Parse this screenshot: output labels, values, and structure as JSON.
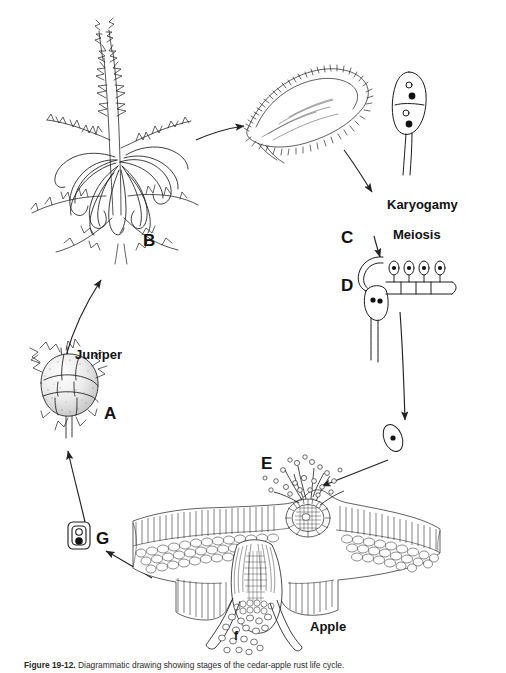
{
  "figure": {
    "title": "Cedar-apple rust life cycle",
    "stroke_color": "#1a1a1a",
    "fill_color": "#ffffff",
    "background": "#ffffff"
  },
  "labels": {
    "stage_a": "A",
    "stage_b": "B",
    "stage_c": "C",
    "stage_d": "D",
    "stage_e": "E",
    "stage_f": "f",
    "stage_g": "G",
    "host_juniper": "Juniper",
    "host_apple": "Apple",
    "process_karyogamy": "Karyogamy",
    "process_meiosis": "Meiosis"
  },
  "caption": {
    "prefix": "Figure 19-12.",
    "text": "Diagrammatic drawing showing stages of the cedar-apple rust life cycle."
  },
  "stages": [
    {
      "id": "A",
      "label": "A",
      "name": "juniper-gall",
      "description": "Mature gall on juniper"
    },
    {
      "id": "B",
      "label": "B",
      "name": "telial-horns",
      "description": "Gelatinous telial horns on juniper branch"
    },
    {
      "id": "C",
      "label": "C",
      "name": "teliospore",
      "description": "Two-celled teliospore germinating"
    },
    {
      "id": "D",
      "label": "D",
      "name": "basidium",
      "description": "Basidium with four basidiospores"
    },
    {
      "id": "E",
      "label": "E",
      "name": "spermogonium",
      "description": "Spermogonium on apple leaf upper surface"
    },
    {
      "id": "f",
      "label": "f",
      "name": "aeciospores",
      "description": "Aeciospores released from aecium"
    },
    {
      "id": "G",
      "label": "G",
      "name": "aeciospore",
      "description": "Binucleate aeciospore"
    }
  ]
}
